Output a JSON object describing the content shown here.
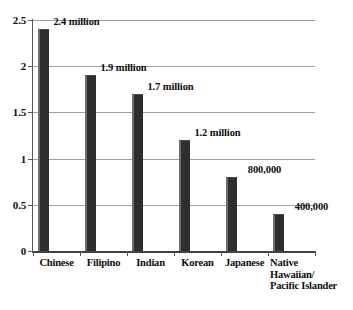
{
  "chart_data": {
    "type": "bar",
    "title": "",
    "subtitle": "",
    "xlabel": "",
    "ylabel": "",
    "categories": [
      "Chinese",
      "Filipino",
      "Indian",
      "Korean",
      "Japanese",
      "Native\nHawaiian/\nPacific Islander"
    ],
    "values": [
      2.4,
      1.9,
      1.7,
      1.2,
      0.8,
      0.4
    ],
    "value_unit": "millions",
    "data_labels": [
      "2.4 million",
      "1.9 million",
      "1.7 million",
      "1.2 million",
      "800,000",
      "400,000"
    ],
    "ylim": [
      0,
      2.5
    ],
    "ytick_values": [
      0,
      0.5,
      1,
      1.5,
      2,
      2.5
    ],
    "ytick_labels": [
      "0",
      "0.5",
      "1",
      "1.5",
      "2",
      "2.5"
    ],
    "grid": true,
    "grid_axis": "y",
    "legend": false,
    "legend_position": "none",
    "colors": {
      "bar_fill": "#2e2e2e",
      "bar_highlight": "#6e6e6e",
      "gridline": "#9aa0a4",
      "axis": "#3d4347",
      "text": "#0d0d0d",
      "background": "#ffffff"
    }
  }
}
